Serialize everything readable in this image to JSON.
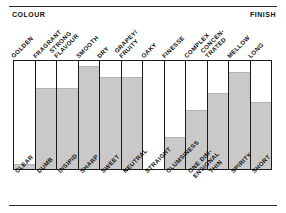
{
  "header": {
    "left_label": "COLOUR",
    "right_label": "FINISH"
  },
  "chart_data": {
    "type": "bar",
    "title": "",
    "subtitle": "",
    "xlabel": "",
    "ylabel": "",
    "ylim": [
      0,
      100
    ],
    "grid": false,
    "legend": null,
    "axis_note": "Each column is a bipolar scale: positive descriptor printed above the frame, negative descriptor printed below the frame. Grey fill height = rating on that scale.",
    "top_axis_title": "COLOUR",
    "bottom_axis_title": "FINISH",
    "categories": [
      "GOLDEN",
      "FRAGRANT",
      "STRONG FLAVOUR",
      "SMOOTH",
      "DRY",
      "GRAPEY/ FRUITY",
      "OAKY",
      "FINESSE",
      "COMPLEX",
      "CONCEN- TRATED",
      "MELLOW",
      "LONG"
    ],
    "categories_lines": [
      [
        "GOLDEN"
      ],
      [
        "FRAGRANT"
      ],
      [
        "STRONG",
        "FLAVOUR"
      ],
      [
        "SMOOTH"
      ],
      [
        "DRY"
      ],
      [
        "GRAPEY/",
        "FRUITY"
      ],
      [
        "OAKY"
      ],
      [
        "FINESSE"
      ],
      [
        "COMPLEX"
      ],
      [
        "CONCEN-",
        "TRATED"
      ],
      [
        "MELLOW"
      ],
      [
        "LONG"
      ]
    ],
    "opposites": [
      "CLEAR",
      "DUMB",
      "INSIPID",
      "SHARP",
      "SWEET",
      "NEUTRAL",
      "STRAIGHT",
      "CLUMSINESS",
      "ONE DIM- ENSIONAL",
      "THIN",
      "SPIRITY",
      "SHORT"
    ],
    "opposites_lines": [
      [
        "CLEAR"
      ],
      [
        "DUMB"
      ],
      [
        "INSIPID"
      ],
      [
        "SHARP"
      ],
      [
        "SWEET"
      ],
      [
        "NEUTRAL"
      ],
      [
        "STRAIGHT"
      ],
      [
        "CLUMSINESS"
      ],
      [
        "ONE DIM-",
        "ENSIONAL"
      ],
      [
        "THIN"
      ],
      [
        "SPIRITY"
      ],
      [
        "SHORT"
      ]
    ],
    "values": [
      5,
      75,
      75,
      95,
      85,
      85,
      0,
      30,
      55,
      70,
      90,
      62
    ],
    "colors": {
      "bar_fill": "#c9c9c9",
      "frame": "#1a1a1a",
      "background": "#ffffff",
      "text": "#111111",
      "rule": "#2a2a2a"
    }
  }
}
